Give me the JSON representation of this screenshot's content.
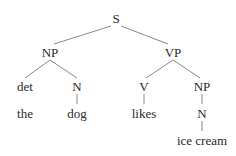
{
  "diagram": {
    "type": "syntax-tree",
    "nodes": [
      {
        "id": "S",
        "label": "S",
        "x": 116,
        "y": 18
      },
      {
        "id": "NP1",
        "label": "NP",
        "x": 50,
        "y": 52
      },
      {
        "id": "VP",
        "label": "VP",
        "x": 173,
        "y": 52
      },
      {
        "id": "det",
        "label": "det",
        "x": 25,
        "y": 86
      },
      {
        "id": "N1",
        "label": "N",
        "x": 77,
        "y": 86
      },
      {
        "id": "V",
        "label": "V",
        "x": 144,
        "y": 86
      },
      {
        "id": "NP2",
        "label": "NP",
        "x": 202,
        "y": 86
      },
      {
        "id": "the",
        "label": "the",
        "x": 25,
        "y": 113
      },
      {
        "id": "dog",
        "label": "dog",
        "x": 77,
        "y": 113
      },
      {
        "id": "likes",
        "label": "likes",
        "x": 144,
        "y": 113
      },
      {
        "id": "N2",
        "label": "N",
        "x": 202,
        "y": 113
      },
      {
        "id": "icecream",
        "label": "ice cream",
        "x": 202,
        "y": 140
      }
    ],
    "edges": [
      {
        "from": "S",
        "to": "NP1"
      },
      {
        "from": "S",
        "to": "VP"
      },
      {
        "from": "NP1",
        "to": "det"
      },
      {
        "from": "NP1",
        "to": "N1"
      },
      {
        "from": "VP",
        "to": "V"
      },
      {
        "from": "VP",
        "to": "NP2"
      },
      {
        "from": "N1",
        "to": "dog"
      },
      {
        "from": "V",
        "to": "likes"
      },
      {
        "from": "NP2",
        "to": "N2"
      },
      {
        "from": "N2",
        "to": "icecream"
      }
    ],
    "labels": {
      "S": "S",
      "NP1": "NP",
      "VP": "VP",
      "det": "det",
      "N1": "N",
      "V": "V",
      "NP2": "NP",
      "the": "the",
      "dog": "dog",
      "likes": "likes",
      "N2": "N",
      "icecream": "ice cream"
    }
  }
}
